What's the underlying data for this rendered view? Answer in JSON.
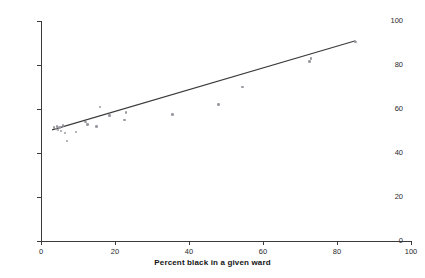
{
  "figure": {
    "top_caption": "",
    "background_color": "#ffffff",
    "point_color": "#9a9aa2",
    "line_color": "#3a3a3a",
    "axis_color": "#3a3a3a"
  },
  "chart_data": {
    "type": "scatter",
    "title": "",
    "xlabel": "Percent black in a given ward",
    "ylabel": "Percent vote Ford received in November 2001 election",
    "xlim": [
      0,
      100
    ],
    "ylim": [
      0,
      100
    ],
    "xticks": [
      0,
      20,
      40,
      60,
      80,
      100
    ],
    "yticks": [
      0,
      20,
      40,
      60,
      80,
      100
    ],
    "grid": false,
    "legend": "none",
    "points": [
      {
        "x": 3.5,
        "y": 51.5
      },
      {
        "x": 4.0,
        "y": 51.0
      },
      {
        "x": 4.3,
        "y": 52.0
      },
      {
        "x": 4.6,
        "y": 50.5
      },
      {
        "x": 5.0,
        "y": 51.5
      },
      {
        "x": 5.4,
        "y": 50.0
      },
      {
        "x": 6.0,
        "y": 52.5
      },
      {
        "x": 6.5,
        "y": 49.0
      },
      {
        "x": 7.0,
        "y": 45.5
      },
      {
        "x": 9.5,
        "y": 49.5
      },
      {
        "x": 12.0,
        "y": 54.0
      },
      {
        "x": 12.5,
        "y": 53.0
      },
      {
        "x": 15.0,
        "y": 52.0
      },
      {
        "x": 16.0,
        "y": 61.0
      },
      {
        "x": 18.5,
        "y": 57.0
      },
      {
        "x": 22.5,
        "y": 55.0
      },
      {
        "x": 23.0,
        "y": 58.5
      },
      {
        "x": 35.5,
        "y": 57.5
      },
      {
        "x": 48.0,
        "y": 62.0
      },
      {
        "x": 54.5,
        "y": 70.0
      },
      {
        "x": 72.5,
        "y": 81.5
      },
      {
        "x": 73.0,
        "y": 83.0
      },
      {
        "x": 85.0,
        "y": 90.5
      }
    ],
    "fit_line": {
      "type": "linear-regression",
      "x_start": 3.0,
      "y_start": 50.5,
      "x_end": 85.0,
      "y_end": 91.0
    }
  }
}
